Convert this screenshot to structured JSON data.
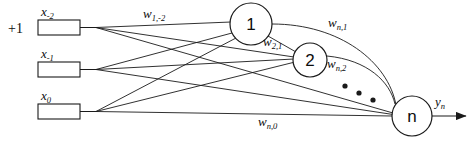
{
  "diagram": {
    "bias_label": "+1",
    "stroke_color": "#1a1a1a",
    "fill_color": "#ffffff",
    "background": "#ffffff",
    "inputs": [
      {
        "name": "input-box-x-minus-2",
        "symbol": "x",
        "subscript": "-2",
        "box_x": 38,
        "box_y": 20,
        "box_w": 42,
        "box_h": 15
      },
      {
        "name": "input-box-x-minus-1",
        "symbol": "x",
        "subscript": "-1",
        "box_x": 38,
        "box_y": 62,
        "box_w": 42,
        "box_h": 15
      },
      {
        "name": "input-box-x-0",
        "symbol": "x",
        "subscript": "0",
        "box_x": 38,
        "box_y": 104,
        "box_w": 42,
        "box_h": 15
      }
    ],
    "neurons": [
      {
        "name": "neuron-1",
        "label": "1",
        "cx": 251,
        "cy": 24,
        "r": 21
      },
      {
        "name": "neuron-2",
        "label": "2",
        "cx": 310,
        "cy": 60,
        "r": 17
      },
      {
        "name": "neuron-n",
        "label": "n",
        "cx": 412,
        "cy": 116,
        "r": 20
      }
    ],
    "weights": [
      {
        "name": "weight-w-1-minus-2",
        "symbol": "w",
        "subscript": "1,-2",
        "x": 143,
        "y": 13
      },
      {
        "name": "weight-w-2-1",
        "symbol": "w",
        "subscript": "2,1",
        "x": 263,
        "y": 41
      },
      {
        "name": "weight-w-n-1",
        "symbol": "w",
        "subscript": "n,1",
        "x": 328,
        "y": 22
      },
      {
        "name": "weight-w-n-2",
        "symbol": "w",
        "subscript": "n,2",
        "x": 327,
        "y": 63
      },
      {
        "name": "weight-w-n-0",
        "symbol": "w",
        "subscript": "n,0",
        "x": 258,
        "y": 121
      }
    ],
    "output": {
      "name": "output-signal-y-n",
      "symbol": "y",
      "subscript": "n",
      "label_x": 435,
      "label_y": 99,
      "arrow_start_x": 432,
      "arrow_end_x": 468,
      "arrow_y": 116
    },
    "ellipsis_dots": [
      {
        "cx": 345,
        "cy": 86,
        "r": 2.6
      },
      {
        "cx": 359,
        "cy": 93,
        "r": 2.6
      },
      {
        "cx": 373,
        "cy": 100,
        "r": 2.6
      }
    ]
  }
}
